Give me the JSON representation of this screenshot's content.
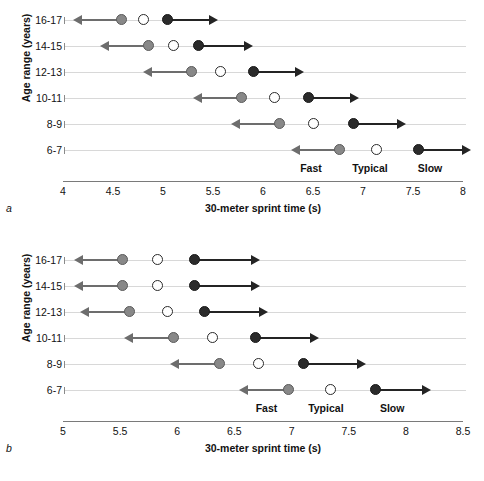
{
  "figure": {
    "background": "#ffffff",
    "colors": {
      "fast_marker": "#888888",
      "typical_marker": "#ffffff",
      "slow_marker": "#2b2b2b",
      "left_arrow": "#6d6d6d",
      "right_arrow": "#242424",
      "row_line": "#d8d8d8",
      "axis": "#7a7a7a"
    }
  },
  "chart_data": [
    {
      "id": "panel_a",
      "panel_letter": "a",
      "type": "scatter",
      "title": "",
      "xlabel": "30-meter sprint time (s)",
      "ylabel": "Age range (years)",
      "xlim": [
        4,
        8
      ],
      "xticks": [
        4,
        4.5,
        5,
        5.5,
        6,
        6.5,
        7,
        7.5,
        8
      ],
      "xtick_labels": [
        "4",
        "4.5",
        "5",
        "5.5",
        "6",
        "6.5",
        "7",
        "7.5",
        "8"
      ],
      "grid": false,
      "legend_position": "inline-bottom",
      "categories": [
        "16-17",
        "14-15",
        "12-13",
        "10-11",
        "8-9",
        "6-7"
      ],
      "series": [
        {
          "name": "Fast",
          "marker": "filled-gray-circle",
          "arrow": "left",
          "values": [
            4.58,
            4.85,
            5.28,
            5.78,
            6.16,
            6.76
          ],
          "arrow_ends": [
            4.18,
            4.45,
            4.88,
            5.38,
            5.76,
            6.36
          ]
        },
        {
          "name": "Typical",
          "marker": "open-circle",
          "arrow": "none",
          "values": [
            4.8,
            5.1,
            5.57,
            6.11,
            6.5,
            7.13
          ],
          "arrow_ends": [
            null,
            null,
            null,
            null,
            null,
            null
          ]
        },
        {
          "name": "Slow",
          "marker": "filled-black-circle",
          "arrow": "right",
          "values": [
            5.04,
            5.35,
            5.9,
            6.45,
            6.9,
            7.55
          ],
          "arrow_ends": [
            5.47,
            5.82,
            6.33,
            6.88,
            7.35,
            8.0
          ]
        }
      ],
      "zone_labels": [
        {
          "text": "Fast",
          "x": 6.48
        },
        {
          "text": "Typical",
          "x": 7.07
        },
        {
          "text": "Slow",
          "x": 7.67
        }
      ]
    },
    {
      "id": "panel_b",
      "panel_letter": "b",
      "type": "scatter",
      "title": "",
      "xlabel": "30-meter sprint time (s)",
      "ylabel": "Age range (years)",
      "xlim": [
        5,
        8.5
      ],
      "xticks": [
        5,
        5.5,
        6,
        6.5,
        7,
        7.5,
        8,
        8.5
      ],
      "xtick_labels": [
        "5",
        "5.5",
        "6",
        "6.5",
        "7",
        "7.5",
        "8",
        "8.5"
      ],
      "grid": false,
      "legend_position": "inline-bottom",
      "categories": [
        "16-17",
        "14-15",
        "12-13",
        "10-11",
        "8-9",
        "6-7"
      ],
      "series": [
        {
          "name": "Fast",
          "marker": "filled-gray-circle",
          "arrow": "left",
          "values": [
            5.52,
            5.52,
            5.58,
            5.97,
            6.37,
            6.97
          ],
          "arrow_ends": [
            5.17,
            5.17,
            5.22,
            5.6,
            6.01,
            6.61
          ]
        },
        {
          "name": "Typical",
          "marker": "open-circle",
          "arrow": "none",
          "values": [
            5.83,
            5.83,
            5.91,
            6.31,
            6.71,
            7.34
          ],
          "arrow_ends": [
            null,
            null,
            null,
            null,
            null,
            null
          ]
        },
        {
          "name": "Slow",
          "marker": "filled-black-circle",
          "arrow": "right",
          "values": [
            6.15,
            6.15,
            6.24,
            6.68,
            7.1,
            7.73
          ],
          "arrow_ends": [
            6.65,
            6.65,
            6.72,
            7.17,
            7.58,
            8.15
          ]
        }
      ],
      "zone_labels": [
        {
          "text": "Fast",
          "x": 6.78
        },
        {
          "text": "Typical",
          "x": 7.3
        },
        {
          "text": "Slow",
          "x": 7.88
        }
      ]
    }
  ]
}
